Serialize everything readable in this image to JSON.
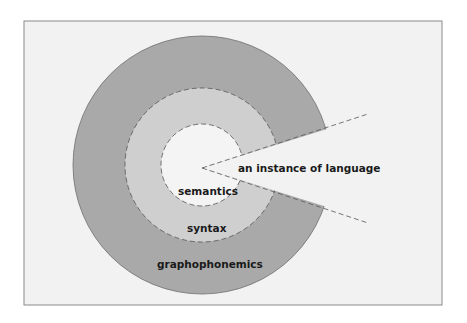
{
  "diagram": {
    "labels": {
      "instance": "an instance of language",
      "semantics": "semantics",
      "syntax": "syntax",
      "graphophonemics": "graphophonemics"
    },
    "colors": {
      "background": "#f2f2f2",
      "frame": "#8a8a8a",
      "outer_ring": "#a9a9a9",
      "middle_ring": "#cfcfcf",
      "inner_circle": "#f4f4f4"
    }
  }
}
